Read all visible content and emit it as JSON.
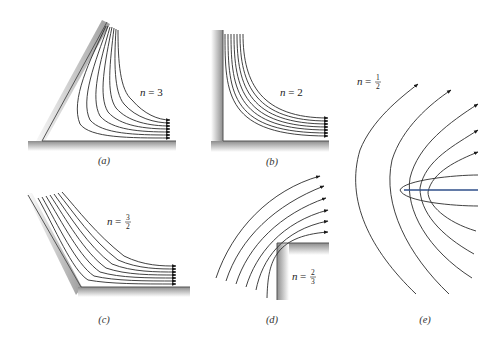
{
  "figure": {
    "colors": {
      "streamline": "#2b2b2b",
      "wall_shadow": "#9a9a9a",
      "stagnation_line": "#2f4f8a",
      "background": "#ffffff"
    },
    "panels": [
      {
        "id": "a",
        "caption": "(a)",
        "n_label": "n = 3",
        "n_var": "n",
        "n_value": "3",
        "description": "Flow in a 60° corner",
        "streamline_count": 7
      },
      {
        "id": "b",
        "caption": "(b)",
        "n_label": "n = 2",
        "n_var": "n",
        "n_value": "2",
        "description": "Flow in a 90° corner",
        "streamline_count": 7
      },
      {
        "id": "c",
        "caption": "(c)",
        "n_label": "n = 3/2",
        "n_var": "n",
        "n_num": "3",
        "n_den": "2",
        "description": "Flow in a 120° corner",
        "streamline_count": 7
      },
      {
        "id": "d",
        "caption": "(d)",
        "n_label": "n = 2/3",
        "n_var": "n",
        "n_num": "2",
        "n_den": "3",
        "description": "Flow around a 270° (external) corner",
        "streamline_count": 6
      },
      {
        "id": "e",
        "caption": "(e)",
        "n_label": "n = 1/2",
        "n_var": "n",
        "n_num": "1",
        "n_den": "2",
        "description": "Flow around a flat plate (semi-infinite)",
        "streamline_count": 10
      }
    ]
  }
}
